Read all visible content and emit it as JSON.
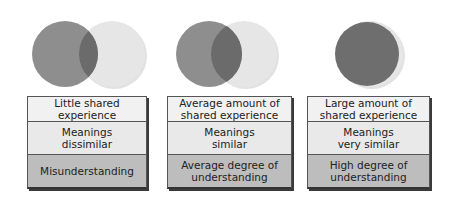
{
  "colors": {
    "dark_circle": "#8e8e8e",
    "light_circle": "#e6e6e6",
    "overlap": "#6b6b6b",
    "row_top": "#f1f1f1",
    "row_middle": "#e9e9e9",
    "row_bottom": "#bdbdbd",
    "border": "#555555"
  },
  "panels": [
    {
      "venn_overlap": "small",
      "shared_experience": "Little shared\nexperience",
      "meanings": "Meanings\ndissimilar",
      "understanding": "Misunderstanding"
    },
    {
      "venn_overlap": "medium",
      "shared_experience": "Average amount of\nshared experience",
      "meanings": "Meanings\nsimilar",
      "understanding": "Average degree of\nunderstanding"
    },
    {
      "venn_overlap": "large",
      "shared_experience": "Large amount of\nshared experience",
      "meanings": "Meanings\nvery similar",
      "understanding": "High degree of\nunderstanding"
    }
  ]
}
